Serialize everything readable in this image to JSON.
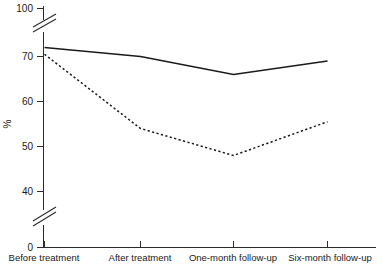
{
  "chart_data": {
    "type": "line",
    "title": "",
    "xlabel": "",
    "ylabel": "%",
    "categories": [
      "Before treatment",
      "After treatment",
      "One-month follow-up",
      "Six-month follow-up"
    ],
    "series": [
      {
        "name": "solid-series",
        "style": "solid",
        "values": [
          72,
          70,
          66,
          69
        ]
      },
      {
        "name": "dashed-series",
        "style": "dashed",
        "values": [
          70.5,
          54,
          48,
          55.5
        ]
      }
    ],
    "ylim": [
      0,
      100
    ],
    "yticks": [
      0,
      40,
      50,
      60,
      70,
      100
    ],
    "ytick_labels": [
      "0",
      "40",
      "50",
      "60",
      "70",
      "100"
    ],
    "axis_breaks": [
      {
        "between": [
          40,
          50
        ],
        "note": "lower-axis-break"
      },
      {
        "between": [
          70,
          100
        ],
        "note": "upper-axis-break"
      }
    ],
    "grid": false,
    "legend": "none"
  },
  "axis": {
    "y_title": "%",
    "ticks": [
      {
        "label": "100",
        "value": 100
      },
      {
        "label": "70",
        "value": 70
      },
      {
        "label": "60",
        "value": 60
      },
      {
        "label": "50",
        "value": 50
      },
      {
        "label": "40",
        "value": 40
      },
      {
        "label": "0",
        "value": 0
      }
    ],
    "categories": [
      {
        "label": "Before treatment"
      },
      {
        "label": "After treatment"
      },
      {
        "label": "One-month follow-up"
      },
      {
        "label": "Six-month follow-up"
      }
    ]
  },
  "colors": {
    "axis": "#2b2b2b",
    "line": "#1a1a1a",
    "background": "#ffffff"
  }
}
